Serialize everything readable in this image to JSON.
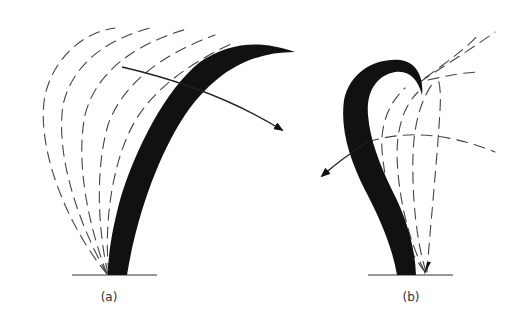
{
  "figure": {
    "panels": [
      {
        "id": "a",
        "label": "(a)",
        "description": "Solid curved frond bending right with successive dashed earlier positions to the left; arrow indicating motion to the right"
      },
      {
        "id": "b",
        "label": "(b)",
        "description": "Solid hooked (S-shaped) frond with dashed trajectories to the right; arrow indicating motion to the left"
      }
    ],
    "colors": {
      "ink": "#111111",
      "dash": "#444444",
      "background": "#ffffff"
    }
  }
}
